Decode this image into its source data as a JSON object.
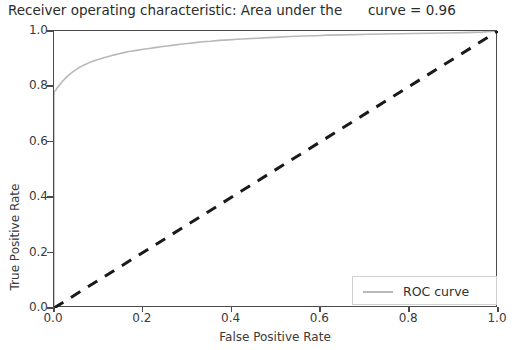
{
  "chart_data": {
    "type": "line",
    "title": "Receiver operating characteristic: Area under the      curve = 0.96",
    "title_main": "Receiver operating characteristic: Area under the",
    "title_auc_text": "curve = 0.96",
    "auc": 0.96,
    "xlabel": "False Positive Rate",
    "ylabel": "True Positive Rate",
    "xlim": [
      0.0,
      1.0
    ],
    "ylim": [
      0.0,
      1.0
    ],
    "grid": false,
    "legend_position": "lower right",
    "xticks": [
      "0.0",
      "0.2",
      "0.4",
      "0.6",
      "0.8",
      "1.0"
    ],
    "xtick_values": [
      0.0,
      0.2,
      0.4,
      0.6,
      0.8,
      1.0
    ],
    "yticks": [
      "0.0",
      "0.2",
      "0.4",
      "0.6",
      "0.8",
      "1.0"
    ],
    "ytick_values": [
      0.0,
      0.2,
      0.4,
      0.6,
      0.8,
      1.0
    ],
    "series": [
      {
        "name": "ROC curve",
        "color": "#b8b8b8",
        "style": "solid",
        "width": 1.6,
        "x": [
          0.0,
          0.0,
          0.004,
          0.006,
          0.008,
          0.01,
          0.013,
          0.016,
          0.019,
          0.022,
          0.026,
          0.03,
          0.034,
          0.038,
          0.043,
          0.048,
          0.053,
          0.058,
          0.064,
          0.07,
          0.077,
          0.084,
          0.091,
          0.099,
          0.107,
          0.116,
          0.125,
          0.134,
          0.144,
          0.155,
          0.166,
          0.177,
          0.189,
          0.201,
          0.214,
          0.227,
          0.241,
          0.255,
          0.27,
          0.285,
          0.301,
          0.318,
          0.335,
          0.353,
          0.372,
          0.392,
          0.413,
          0.435,
          0.458,
          0.482,
          0.507,
          0.533,
          0.56,
          0.588,
          0.617,
          0.647,
          0.678,
          0.71,
          0.743,
          0.777,
          0.812,
          0.848,
          0.885,
          0.923,
          0.962,
          1.0
        ],
        "y": [
          0.0,
          0.78,
          0.786,
          0.792,
          0.797,
          0.8,
          0.806,
          0.812,
          0.818,
          0.823,
          0.83,
          0.836,
          0.842,
          0.847,
          0.853,
          0.859,
          0.864,
          0.869,
          0.874,
          0.879,
          0.884,
          0.889,
          0.893,
          0.897,
          0.901,
          0.905,
          0.909,
          0.913,
          0.917,
          0.921,
          0.925,
          0.928,
          0.931,
          0.934,
          0.937,
          0.94,
          0.943,
          0.946,
          0.949,
          0.952,
          0.955,
          0.958,
          0.961,
          0.963,
          0.966,
          0.968,
          0.97,
          0.972,
          0.974,
          0.976,
          0.978,
          0.98,
          0.982,
          0.983,
          0.985,
          0.986,
          0.987,
          0.988,
          0.989,
          0.99,
          0.991,
          0.992,
          0.993,
          0.994,
          0.996,
          1.0
        ]
      },
      {
        "name": "chance-diagonal",
        "color": "#1a1a1a",
        "style": "dashed",
        "width": 3.0,
        "x": [
          0.0,
          1.0
        ],
        "y": [
          0.0,
          1.0
        ]
      }
    ],
    "legend": [
      {
        "label": "ROC curve",
        "color": "#b8b8b8",
        "style": "solid"
      }
    ]
  }
}
